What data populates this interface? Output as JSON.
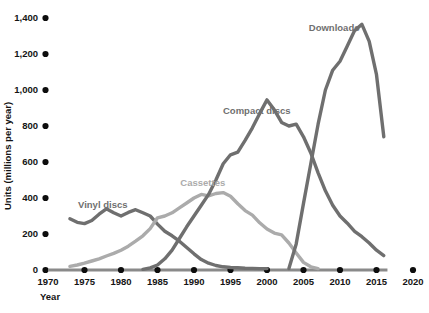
{
  "chart_data": {
    "type": "line",
    "title": "",
    "xlabel": "Year",
    "ylabel": "Units (millions per year)",
    "xlim": [
      1970,
      2020
    ],
    "ylim": [
      0,
      1400
    ],
    "grid": false,
    "legend_position": "inline-annotations",
    "x_ticks": [
      1970,
      1975,
      1980,
      1985,
      1990,
      1995,
      2000,
      2005,
      2010,
      2015,
      2020
    ],
    "y_ticks": [
      0,
      200,
      400,
      600,
      800,
      1000,
      1200,
      1400
    ],
    "y_tick_labels": [
      "0",
      "200",
      "400",
      "600",
      "800",
      "1,000",
      "1,200",
      "1,400"
    ],
    "x_tick_labels": [
      "1970",
      "1975",
      "1980",
      "1985",
      "1990",
      "1995",
      "2000",
      "2005",
      "2010",
      "2015",
      "2020"
    ],
    "series": [
      {
        "name": "Vinyl discs",
        "color": "#6f6f6f",
        "label_x": 1977.5,
        "label_y": 360,
        "points": [
          [
            1973,
            285
          ],
          [
            1974,
            265
          ],
          [
            1975,
            258
          ],
          [
            1976,
            275
          ],
          [
            1977,
            310
          ],
          [
            1978,
            340
          ],
          [
            1979,
            318
          ],
          [
            1980,
            300
          ],
          [
            1981,
            320
          ],
          [
            1982,
            335
          ],
          [
            1983,
            318
          ],
          [
            1984,
            300
          ],
          [
            1985,
            255
          ],
          [
            1986,
            215
          ],
          [
            1987,
            190
          ],
          [
            1988,
            160
          ],
          [
            1989,
            125
          ],
          [
            1990,
            90
          ],
          [
            1991,
            58
          ],
          [
            1992,
            38
          ],
          [
            1993,
            25
          ],
          [
            1994,
            18
          ],
          [
            1995,
            14
          ],
          [
            1996,
            12
          ],
          [
            1997,
            10
          ],
          [
            1998,
            9
          ],
          [
            1999,
            8
          ],
          [
            2000,
            8
          ]
        ]
      },
      {
        "name": "Cassettes",
        "color": "#ababab",
        "label_x": 1991.2,
        "label_y": 480,
        "points": [
          [
            1973,
            20
          ],
          [
            1974,
            28
          ],
          [
            1975,
            38
          ],
          [
            1976,
            50
          ],
          [
            1977,
            62
          ],
          [
            1978,
            78
          ],
          [
            1979,
            92
          ],
          [
            1980,
            110
          ],
          [
            1981,
            132
          ],
          [
            1982,
            160
          ],
          [
            1983,
            190
          ],
          [
            1984,
            230
          ],
          [
            1985,
            290
          ],
          [
            1986,
            300
          ],
          [
            1987,
            318
          ],
          [
            1988,
            345
          ],
          [
            1989,
            372
          ],
          [
            1990,
            400
          ],
          [
            1991,
            420
          ],
          [
            1992,
            412
          ],
          [
            1993,
            425
          ],
          [
            1994,
            430
          ],
          [
            1995,
            410
          ],
          [
            1996,
            368
          ],
          [
            1997,
            330
          ],
          [
            1998,
            305
          ],
          [
            1999,
            262
          ],
          [
            2000,
            228
          ],
          [
            2001,
            205
          ],
          [
            2002,
            195
          ],
          [
            2003,
            150
          ],
          [
            2004,
            95
          ],
          [
            2005,
            42
          ],
          [
            2006,
            18
          ],
          [
            2007,
            8
          ]
        ]
      },
      {
        "name": "Compact discs",
        "color": "#6f6f6f",
        "label_x": 1998.6,
        "label_y": 880,
        "points": [
          [
            1983,
            4
          ],
          [
            1984,
            12
          ],
          [
            1985,
            28
          ],
          [
            1986,
            62
          ],
          [
            1987,
            110
          ],
          [
            1988,
            175
          ],
          [
            1989,
            240
          ],
          [
            1990,
            300
          ],
          [
            1991,
            360
          ],
          [
            1992,
            420
          ],
          [
            1993,
            500
          ],
          [
            1994,
            590
          ],
          [
            1995,
            640
          ],
          [
            1996,
            655
          ],
          [
            1997,
            720
          ],
          [
            1998,
            790
          ],
          [
            1999,
            870
          ],
          [
            2000,
            945
          ],
          [
            2001,
            890
          ],
          [
            2002,
            820
          ],
          [
            2003,
            800
          ],
          [
            2004,
            810
          ],
          [
            2005,
            740
          ],
          [
            2006,
            650
          ],
          [
            2007,
            540
          ],
          [
            2008,
            440
          ],
          [
            2009,
            360
          ],
          [
            2010,
            300
          ],
          [
            2011,
            260
          ],
          [
            2012,
            215
          ],
          [
            2013,
            185
          ],
          [
            2014,
            150
          ],
          [
            2015,
            110
          ],
          [
            2016,
            80
          ]
        ]
      },
      {
        "name": "Downloads",
        "color": "#6f6f6f",
        "label_x": 2009.2,
        "label_y": 1340,
        "points": [
          [
            2003,
            8
          ],
          [
            2004,
            145
          ],
          [
            2005,
            370
          ],
          [
            2006,
            590
          ],
          [
            2007,
            810
          ],
          [
            2008,
            1000
          ],
          [
            2009,
            1110
          ],
          [
            2010,
            1160
          ],
          [
            2011,
            1245
          ],
          [
            2012,
            1330
          ],
          [
            2013,
            1365
          ],
          [
            2014,
            1270
          ],
          [
            2015,
            1085
          ],
          [
            2016,
            740
          ]
        ]
      }
    ]
  }
}
